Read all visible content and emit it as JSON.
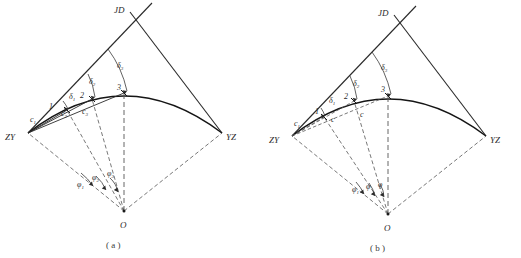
{
  "figure": {
    "type": "engineering-survey-diagram",
    "panels": [
      {
        "caption": "( a )",
        "variant": "unequal-chord",
        "points": {
          "tangent_start": "ZY",
          "tangent_end": "YZ",
          "intersection": "JD",
          "center": "O",
          "curve_points": [
            "1",
            "2",
            "3"
          ]
        },
        "chords": [
          "c",
          "c",
          "c"
        ],
        "chord_subs": [
          "1",
          "2",
          "3"
        ],
        "deflection_angles": [
          "δ",
          "δ",
          "δ"
        ],
        "deflection_subs": [
          "1",
          "2",
          "3"
        ],
        "central_angles": [
          "φ",
          "φ",
          "φ"
        ],
        "central_subs": [
          "1",
          "2",
          "3"
        ]
      },
      {
        "caption": "( b )",
        "variant": "equal-chord",
        "points": {
          "tangent_start": "ZY",
          "tangent_end": "YZ",
          "intersection": "JD",
          "center": "O",
          "curve_points": [
            "1",
            "2",
            "3"
          ]
        },
        "chords": [
          "c",
          "c",
          "c"
        ],
        "chord_subs": [
          "1",
          "",
          ""
        ],
        "deflection_angles": [
          "δ",
          "δ",
          "δ"
        ],
        "deflection_subs": [
          "1",
          "2",
          "3"
        ],
        "central_angles": [
          "φ",
          "φ",
          "φ"
        ],
        "central_subs": [
          "1",
          "",
          ""
        ]
      }
    ],
    "colors": {
      "curve": "#1a1a1a",
      "tangent": "#2a2a2a",
      "dashed": "#555555",
      "label": "#2b2b2b",
      "background": "#ffffff"
    }
  }
}
